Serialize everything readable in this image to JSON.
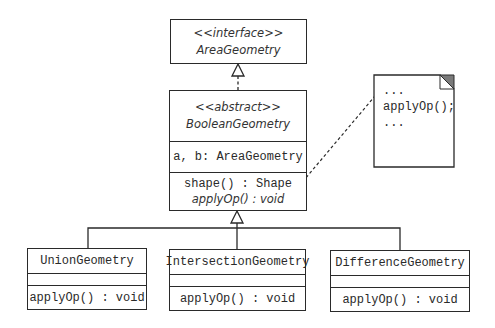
{
  "diagram": {
    "type": "UML class diagram",
    "interface": {
      "stereotype": "<<interface>>",
      "name": "AreaGeometry"
    },
    "abstract_class": {
      "stereotype": "<<abstract>>",
      "name": "BooleanGeometry",
      "attributes": [
        "a, b: AreaGeometry"
      ],
      "methods": [
        "shape() : Shape",
        "applyOp() : void"
      ]
    },
    "subclasses": [
      {
        "name": "UnionGeometry",
        "methods": [
          "applyOp() : void"
        ]
      },
      {
        "name": "IntersectionGeometry",
        "methods": [
          "applyOp() : void"
        ]
      },
      {
        "name": "DifferenceGeometry",
        "methods": [
          "applyOp() : void"
        ]
      }
    ],
    "note": {
      "lines": [
        "...",
        "applyOp();",
        "..."
      ]
    },
    "relationships": [
      {
        "from": "BooleanGeometry",
        "to": "AreaGeometry",
        "kind": "realization"
      },
      {
        "from": "UnionGeometry",
        "to": "BooleanGeometry",
        "kind": "generalization"
      },
      {
        "from": "IntersectionGeometry",
        "to": "BooleanGeometry",
        "kind": "generalization"
      },
      {
        "from": "DifferenceGeometry",
        "to": "BooleanGeometry",
        "kind": "generalization"
      },
      {
        "from": "note",
        "to": "BooleanGeometry.shape()",
        "kind": "note-anchor"
      }
    ],
    "colors": {
      "line": "#2a2a2a",
      "note_corner": "#7a7a7a",
      "background": "#ffffff"
    }
  }
}
